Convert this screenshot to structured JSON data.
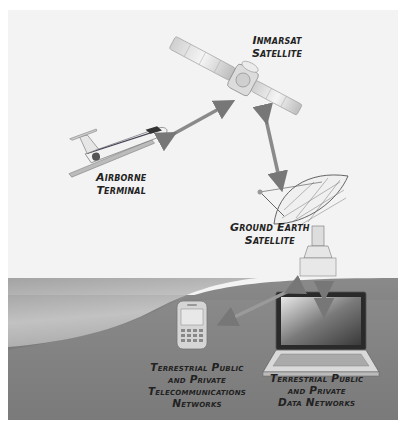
{
  "diagram": {
    "type": "network-topology",
    "nodes": [
      {
        "id": "satellite",
        "label_lines": [
          "Inmarsat",
          "Satellite"
        ],
        "icon": "satellite-icon"
      },
      {
        "id": "airborne",
        "label_lines": [
          "Airborne",
          "Terminal"
        ],
        "icon": "airplane-icon"
      },
      {
        "id": "ground",
        "label_lines": [
          "Ground Earth",
          "Satellite"
        ],
        "icon": "satellite-dish-icon"
      },
      {
        "id": "telecom",
        "label_lines": [
          "Terrestrial Public",
          "and Private",
          "Telecommunications",
          "Networks"
        ],
        "icon": "mobile-phone-icon"
      },
      {
        "id": "data",
        "label_lines": [
          "Terrestrial Public",
          "and Private",
          "Data Networks"
        ],
        "icon": "laptop-icon"
      }
    ],
    "links": [
      {
        "from": "airborne",
        "to": "satellite",
        "bidirectional": true
      },
      {
        "from": "satellite",
        "to": "ground",
        "bidirectional": true
      },
      {
        "from": "ground",
        "to": "telecom",
        "bidirectional": true
      },
      {
        "from": "ground",
        "to": "data",
        "bidirectional": true
      }
    ]
  },
  "colors": {
    "sky": "#f3f3f3",
    "ground": "#858585",
    "ground_light": "#bdbdbd",
    "label": "#222222"
  }
}
